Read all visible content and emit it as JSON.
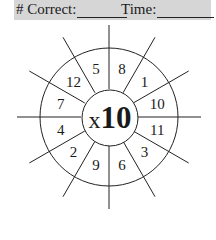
{
  "header": {
    "correct_label": "# Correct:",
    "time_label": "Time:",
    "background": "#d6d6d6"
  },
  "wheel": {
    "operator": "x",
    "factor": "10",
    "numbers": [
      {
        "value": "8",
        "angle": 75
      },
      {
        "value": "1",
        "angle": 45
      },
      {
        "value": "10",
        "angle": 15
      },
      {
        "value": "11",
        "angle": -15
      },
      {
        "value": "3",
        "angle": -45
      },
      {
        "value": "6",
        "angle": -75
      },
      {
        "value": "9",
        "angle": -105
      },
      {
        "value": "2",
        "angle": -135
      },
      {
        "value": "4",
        "angle": -165
      },
      {
        "value": "7",
        "angle": 165
      },
      {
        "value": "12",
        "angle": 135
      },
      {
        "value": "5",
        "angle": 105
      }
    ]
  }
}
